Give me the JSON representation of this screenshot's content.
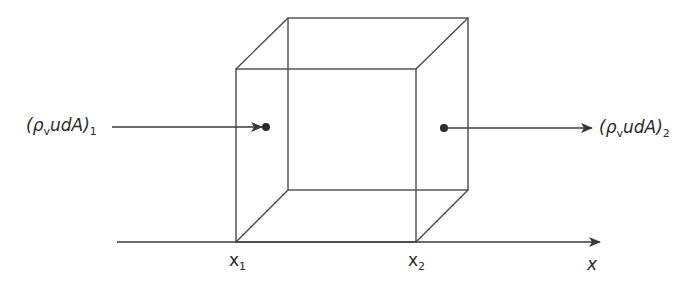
{
  "diagram": {
    "inflow_label": {
      "base": "(ρ",
      "sub_v": "v",
      "mid": "udA)",
      "sub": "1"
    },
    "outflow_label": {
      "base": "(ρ",
      "sub_v": "v",
      "mid": "udA)",
      "sub": "2"
    },
    "axis": {
      "label": "x",
      "ticks": [
        {
          "base": "x",
          "sub": "1"
        },
        {
          "base": "x",
          "sub": "2"
        }
      ]
    },
    "colors": {
      "line": "#3a3a3a",
      "text": "#2a2a2a",
      "background": "#ffffff"
    }
  }
}
